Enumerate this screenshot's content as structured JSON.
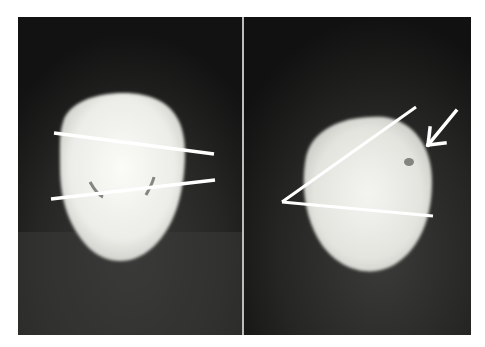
{
  "figure": {
    "panels": [
      {
        "id": "left",
        "subject": "tooth-occlusal-view",
        "annotation": "two-parallel-lines"
      },
      {
        "id": "right",
        "subject": "tooth-occlusal-view",
        "annotation": "angle-lines-with-arrow"
      }
    ],
    "colors": {
      "background": "#161616",
      "specimen": "#eeeeea",
      "annotation": "#ffffff",
      "divider": "#bdbdbd"
    }
  }
}
